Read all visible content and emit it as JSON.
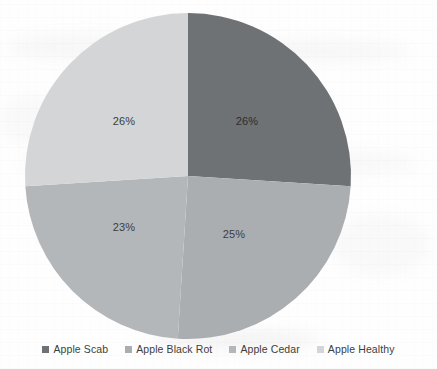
{
  "chart_data": {
    "type": "pie",
    "title": "",
    "subtitle": "",
    "xlabel": "",
    "ylabel": "",
    "legend_position": "bottom",
    "grid": false,
    "categories": [
      "Apple Scab",
      "Apple Black Rot",
      "Apple Cedar",
      "Apple Healthy"
    ],
    "values": [
      26,
      25,
      23,
      26
    ],
    "value_unit": "%",
    "start_angle_deg": 0,
    "direction": "clockwise",
    "slices": [
      {
        "label": "Apple Scab",
        "value": 26,
        "display": "26%",
        "color": "#6e7275",
        "start_deg": 0,
        "end_deg": 93.6,
        "label_x": 247,
        "label_y": 121
      },
      {
        "label": "Apple Black Rot",
        "value": 25,
        "display": "25%",
        "color": "#abaeb0",
        "start_deg": 93.6,
        "end_deg": 183.6,
        "label_x": 234,
        "label_y": 234
      },
      {
        "label": "Apple Cedar",
        "value": 23,
        "display": "23%",
        "color": "#b4b7b9",
        "start_deg": 183.6,
        "end_deg": 266.4,
        "label_x": 124,
        "label_y": 227
      },
      {
        "label": "Apple Healthy",
        "value": 26,
        "display": "26%",
        "color": "#d3d5d6",
        "start_deg": 266.4,
        "end_deg": 360,
        "label_x": 124,
        "label_y": 121
      }
    ],
    "geometry": {
      "center_x": 188,
      "center_y": 176,
      "radius": 163
    },
    "colors": {
      "apple_scab": "#6e7275",
      "apple_black_rot": "#abaeb0",
      "apple_cedar": "#b4b7b9",
      "apple_healthy": "#d3d5d6",
      "label_text": "#3b3d3f",
      "legend_text": "#3c3e40",
      "background": "#fefefe"
    }
  },
  "legend": {
    "items": [
      {
        "label": "Apple Scab",
        "color": "#6e7275"
      },
      {
        "label": "Apple Black Rot",
        "color": "#abaeb0"
      },
      {
        "label": "Apple Cedar",
        "color": "#b4b7b9"
      },
      {
        "label": "Apple Healthy",
        "color": "#d3d5d6"
      }
    ]
  }
}
